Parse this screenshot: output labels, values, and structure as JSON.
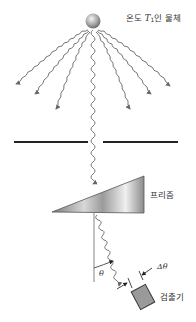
{
  "labels": {
    "source_prefix": "온도 ",
    "source_symbol": "T",
    "source_subscript": "1",
    "source_suffix": "인 물체",
    "prism": "프리즘",
    "detector": "검출기",
    "angle": "θ",
    "delta_angle": "Δθ"
  },
  "colors": {
    "wave": "#777777",
    "barrier": "#222222",
    "prism_dark": "#8a8a8a",
    "prism_light": "#f2f2f2",
    "detector_fill": "#9a9a9a",
    "detector_border": "#333333",
    "text": "#333333"
  },
  "elements": {
    "source": "sphere",
    "barrier": "slit",
    "prism": "triangular-prism",
    "detector": "square-detector"
  }
}
